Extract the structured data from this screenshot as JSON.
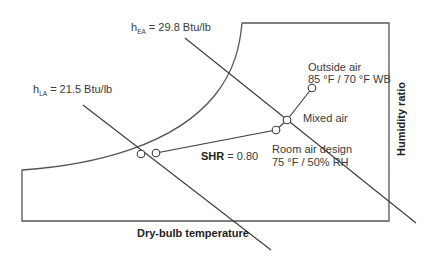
{
  "diagram": {
    "type": "psychrometric-chart-process",
    "axes": {
      "x_label": "Dry-bulb temperature",
      "y_label": "Humidity ratio"
    },
    "enthalpy_lines": [
      {
        "symbol": "h",
        "subscript": "EA",
        "value_text": "= 29.8 Btu/lb"
      },
      {
        "symbol": "h",
        "subscript": "LA",
        "value_text": "= 21.5 Btu/lb"
      }
    ],
    "points": {
      "outside_air": {
        "title": "Outside air",
        "condition": "85 °F / 70 °F WB"
      },
      "mixed_air": {
        "title": "Mixed air"
      },
      "room_air": {
        "title": "Room air design",
        "condition": "75 °F / 50% RH"
      }
    },
    "shr": {
      "label": "SHR",
      "value": "= 0.80"
    }
  },
  "colors": {
    "line": "#3a3a3a",
    "text": "#3a3a3a",
    "background": "#ffffff"
  }
}
